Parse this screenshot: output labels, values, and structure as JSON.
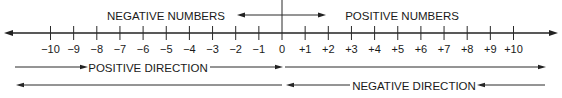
{
  "diagram": {
    "type": "number-line",
    "headings": {
      "negative_numbers": "NEGATIVE NUMBERS",
      "positive_numbers": "POSITIVE NUMBERS"
    },
    "directions": {
      "positive": "POSITIVE DIRECTION",
      "negative": "NEGATIVE DIRECTION"
    },
    "range": [
      -10,
      10
    ],
    "ticks": [
      {
        "value": -10,
        "label": "−10"
      },
      {
        "value": -9,
        "label": "−9"
      },
      {
        "value": -8,
        "label": "−8"
      },
      {
        "value": -7,
        "label": "−7"
      },
      {
        "value": -6,
        "label": "−6"
      },
      {
        "value": -5,
        "label": "−5"
      },
      {
        "value": -4,
        "label": "−4"
      },
      {
        "value": -3,
        "label": "−3"
      },
      {
        "value": -2,
        "label": "−2"
      },
      {
        "value": -1,
        "label": "−1"
      },
      {
        "value": 0,
        "label": "0"
      },
      {
        "value": 1,
        "label": "+1"
      },
      {
        "value": 2,
        "label": "+2"
      },
      {
        "value": 3,
        "label": "+3"
      },
      {
        "value": 4,
        "label": "+4"
      },
      {
        "value": 5,
        "label": "+5"
      },
      {
        "value": 6,
        "label": "+6"
      },
      {
        "value": 7,
        "label": "+7"
      },
      {
        "value": 8,
        "label": "+8"
      },
      {
        "value": 9,
        "label": "+9"
      },
      {
        "value": 10,
        "label": "+10"
      }
    ]
  }
}
